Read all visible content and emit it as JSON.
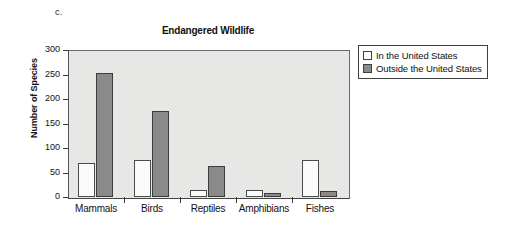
{
  "part_label": "c.",
  "legend": {
    "entries": [
      {
        "label": "In the United States",
        "swatch": "white-square-icon",
        "color": "#ffffff"
      },
      {
        "label": "Outside the United States",
        "swatch": "gray-square-icon",
        "color": "#8a8a8a"
      }
    ]
  },
  "colors": {
    "plot_background": "#e7e7e5",
    "series_in_us": "#fbfbfa",
    "series_outside_us": "#8a8a8a",
    "axis": "#3a3a3a",
    "text": "#111111"
  },
  "chart_data": {
    "type": "bar",
    "title": "Endangered Wildlife",
    "xlabel": "",
    "ylabel": "Number of Species",
    "categories": [
      "Mammals",
      "Birds",
      "Reptiles",
      "Amphibians",
      "Fishes"
    ],
    "series": [
      {
        "name": "In the United States",
        "values": [
          69,
          75,
          14,
          15,
          75
        ]
      },
      {
        "name": "Outside the United States",
        "values": [
          253,
          176,
          63,
          9,
          13
        ]
      }
    ],
    "ylim": [
      0,
      300
    ],
    "yticks": [
      0,
      50,
      100,
      150,
      200,
      250,
      300
    ],
    "ytick_labels": [
      "0",
      "50",
      "100",
      "150",
      "200",
      "250",
      "300"
    ],
    "grid": false,
    "legend_position": "right-outside"
  }
}
